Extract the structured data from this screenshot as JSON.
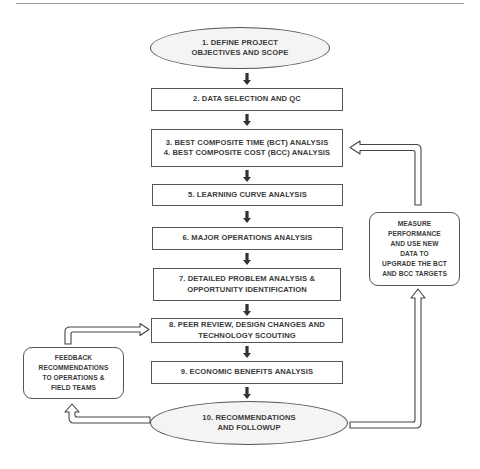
{
  "diagram": {
    "type": "flowchart",
    "steps": [
      {
        "id": "s1",
        "shape": "ellipse",
        "lines": [
          "1. DEFINE PROJECT",
          "OBJECTIVES AND SCOPE"
        ]
      },
      {
        "id": "s2",
        "shape": "box",
        "lines": [
          "2. DATA SELECTION AND QC"
        ]
      },
      {
        "id": "s3",
        "shape": "box",
        "lines": [
          "3. BEST COMPOSITE TIME (BCT) ANALYSIS",
          "4. BEST COMPOSITE COST (BCC) ANALYSIS"
        ]
      },
      {
        "id": "s5",
        "shape": "box",
        "lines": [
          "5. LEARNING CURVE ANALYSIS"
        ]
      },
      {
        "id": "s6",
        "shape": "box",
        "lines": [
          "6. MAJOR OPERATIONS ANALYSIS"
        ]
      },
      {
        "id": "s7",
        "shape": "box",
        "lines": [
          "7. DETAILED PROBLEM ANALYSIS &",
          "OPPORTUNITY IDENTIFICATION"
        ]
      },
      {
        "id": "s8",
        "shape": "box",
        "lines": [
          "8. PEER REVIEW, DESIGN CHANGES AND",
          "TECHNOLOGY SCOUTING"
        ]
      },
      {
        "id": "s9",
        "shape": "box",
        "lines": [
          "9. ECONOMIC BENEFITS ANALYSIS"
        ]
      },
      {
        "id": "s10",
        "shape": "ellipse",
        "lines": [
          "10. RECOMMENDATIONS",
          "AND FOLLOWUP"
        ]
      }
    ],
    "side_nodes": {
      "measure": {
        "shape": "rounded",
        "lines": [
          "MEASURE",
          "PERFORMANCE",
          "AND USE  NEW",
          "DATA TO",
          "UPGRADE THE BCT",
          "AND BCC TARGETS"
        ]
      },
      "feedback": {
        "shape": "rounded",
        "lines": [
          "FEEDBACK",
          "RECOMMENDATIONS",
          "TO OPERATIONS &",
          "FIELD TEAMS"
        ]
      }
    },
    "edges": [
      {
        "from": "s1",
        "to": "s2",
        "style": "solid-down"
      },
      {
        "from": "s2",
        "to": "s3",
        "style": "solid-down"
      },
      {
        "from": "s3",
        "to": "s5",
        "style": "solid-down"
      },
      {
        "from": "s5",
        "to": "s6",
        "style": "solid-down"
      },
      {
        "from": "s6",
        "to": "s7",
        "style": "solid-down"
      },
      {
        "from": "s7",
        "to": "s8",
        "style": "solid-down"
      },
      {
        "from": "s8",
        "to": "s9",
        "style": "solid-down"
      },
      {
        "from": "s9",
        "to": "s10",
        "style": "solid-down"
      },
      {
        "from": "s10",
        "to": "measure",
        "style": "hollow-elbow"
      },
      {
        "from": "measure",
        "to": "s3",
        "style": "hollow-elbow"
      },
      {
        "from": "s10",
        "to": "feedback",
        "style": "hollow-elbow"
      },
      {
        "from": "feedback",
        "to": "s8",
        "style": "hollow-elbow"
      }
    ],
    "colors": {
      "stroke": "#555555",
      "text": "#3a3a3a",
      "ellipse_fill": "#f4f4f4",
      "arrow_fill": "#ffffff",
      "rule": "#9a9a9a"
    }
  },
  "caption": {
    "text": ""
  }
}
